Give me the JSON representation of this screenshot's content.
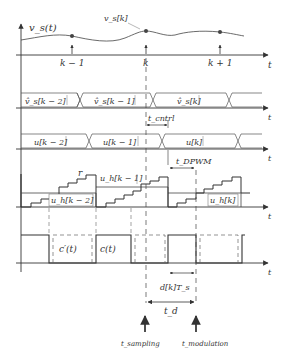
{
  "diagram": {
    "colors": {
      "stroke": "#333333",
      "background": "#ffffff",
      "text": "#333333"
    },
    "row1": {
      "signal_label": "v_s(t)",
      "sample_label": "v_s[k]",
      "ticks": [
        "k − 1",
        "k",
        "k + 1"
      ],
      "axis_label": "t"
    },
    "row2": {
      "segments": [
        "v̂_s[k − 2]",
        "v̂_s[k − 1]",
        "v̂_s[k]"
      ],
      "axis_label": "t",
      "delay_label": "t_cntrl"
    },
    "row3": {
      "segments": [
        "u[k − 2]",
        "u[k − 1]",
        "u[k]"
      ],
      "axis_label": "t",
      "delay_label": "t_DPWM"
    },
    "row4": {
      "ramp_label": "r",
      "levels": [
        "u_h[k − 2]",
        "u_h[k − 1]",
        "u_h[k]"
      ],
      "axis_label": "t"
    },
    "row5": {
      "dashed_label": "c′(t)",
      "solid_label": "c(t)",
      "axis_label": "t",
      "duty_label": "d[k]T_s",
      "delay_label": "t_d"
    },
    "markers": {
      "sampling": "t_sampling",
      "modulation": "t_modulation"
    }
  }
}
